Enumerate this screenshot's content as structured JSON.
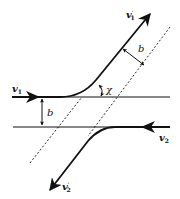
{
  "diagram": {
    "type": "two-body scattering geometry",
    "labels": {
      "v1_in": "v",
      "v1_in_sub": "1",
      "v1_out": "v",
      "v1_out_sub": "1",
      "v1_out_prime": "′",
      "v2_in": "v",
      "v2_in_sub": "2",
      "v2_out": "v",
      "v2_out_sub": "2",
      "v2_out_prime": "′",
      "impact_parameter_top": "b",
      "impact_parameter_left": "b",
      "scattering_angle": "χ"
    },
    "colors": {
      "stroke": "#111111",
      "background": "#ffffff"
    }
  }
}
